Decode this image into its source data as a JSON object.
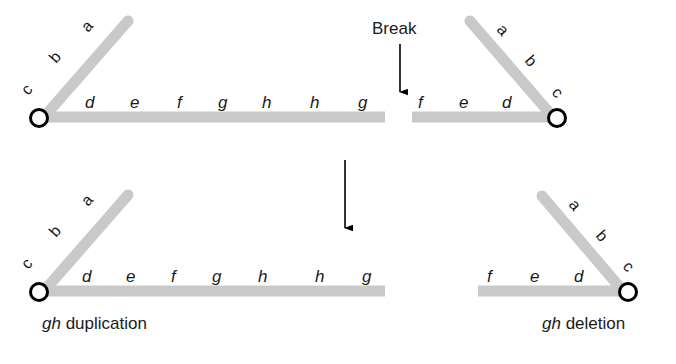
{
  "figure": {
    "colors": {
      "chromatid_gray": "#c9c9c9",
      "centromere_stroke": "#000000",
      "centromere_fill": "#ffffff",
      "text_black": "#1a1a1a",
      "arrow_black": "#000000",
      "background": "#ffffff"
    },
    "annotations": {
      "break_label": "Break"
    },
    "top_row": {
      "left_chromosome": {
        "name": "top-left-chromosome",
        "short_arm_labels": [
          "c",
          "b",
          "a"
        ],
        "long_arm_labels": [
          "d",
          "e",
          "f",
          "g",
          "h",
          "h",
          "g"
        ],
        "centromere": "centromere"
      },
      "right_chromosome": {
        "name": "top-right-chromosome",
        "short_arm_labels": [
          "a",
          "b",
          "c"
        ],
        "long_arm_labels": [
          "f",
          "e",
          "d"
        ],
        "centromere": "centromere"
      }
    },
    "bottom_row": {
      "left_chromosome": {
        "name": "bottom-left-chromosome",
        "short_arm_labels": [
          "c",
          "b",
          "a"
        ],
        "long_arm_labels": [
          "d",
          "e",
          "f",
          "g",
          "h",
          "h",
          "g"
        ],
        "centromere": "centromere",
        "caption_italic": "gh",
        "caption_rest": " duplication"
      },
      "right_chromosome": {
        "name": "bottom-right-chromosome",
        "short_arm_labels": [
          "a",
          "b",
          "c"
        ],
        "long_arm_labels": [
          "f",
          "e",
          "d"
        ],
        "centromere": "centromere",
        "caption_italic": "gh",
        "caption_rest": " deletion"
      }
    }
  }
}
